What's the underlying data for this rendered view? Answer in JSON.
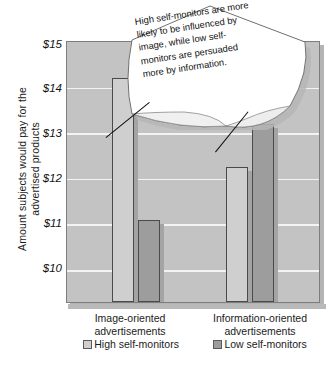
{
  "chart_data": {
    "type": "bar",
    "title": "",
    "xlabel": "",
    "ylabel_lines": [
      "Amount subjects would pay for the",
      "advertised products"
    ],
    "ylabel": "Amount subjects would pay for the advertised products",
    "categories": [
      "Image-oriented advertisements",
      "Information-oriented advertisements"
    ],
    "category_lines": [
      [
        "Image-oriented",
        "advertisements"
      ],
      [
        "Information-oriented",
        "advertisements"
      ]
    ],
    "series": [
      {
        "name": "High self-monitors",
        "values": [
          14.2,
          12.25
        ],
        "color": "#cfcfcf"
      },
      {
        "name": "Low self-monitors",
        "values": [
          11.1,
          13.2
        ],
        "color": "#9d9d9d"
      }
    ],
    "ylim": [
      9.3,
      15.0
    ],
    "ytick_values": [
      15,
      14,
      13,
      12,
      11,
      10
    ],
    "ytick_labels": [
      "$15",
      "$14",
      "$13",
      "$12",
      "$11",
      "$10"
    ],
    "grid": true,
    "legend_position": "bottom",
    "annotations": [
      {
        "name": "insight-note",
        "lines": [
          "High self-monitors are more",
          "likely to be influenced by",
          "image, while low self-",
          "monitors are persuaded",
          "more by information."
        ],
        "text": "High self-monitors are more likely to be influenced by image, while low self-monitors are persuaded more by information."
      }
    ]
  },
  "legend": {
    "items": [
      {
        "label": "High self-monitors"
      },
      {
        "label": "Low self-monitors"
      }
    ]
  },
  "axis": {
    "y": {
      "ticks": [
        "$15",
        "$14",
        "$13",
        "$12",
        "$11",
        "$10"
      ],
      "title_line1": "Amount subjects would pay for the",
      "title_line2": "advertised products"
    },
    "x": {
      "cat1_line1": "Image-oriented",
      "cat1_line2": "advertisements",
      "cat2_line1": "Information-oriented",
      "cat2_line2": "advertisements"
    }
  },
  "note": {
    "line1": "High self-monitors are more",
    "line2": "likely to be influenced by",
    "line3": "image, while low self-",
    "line4": "monitors are persuaded",
    "line5": "more by information."
  }
}
